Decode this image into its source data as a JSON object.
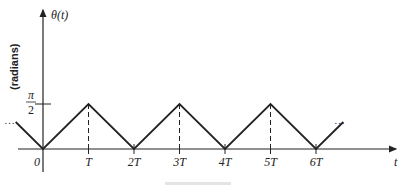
{
  "chart_data": {
    "type": "line",
    "title": "",
    "ylabel_symbol": "θ(t)",
    "ylabel_unit": "(radians)",
    "xlabel": "t",
    "y_tick_label": {
      "numerator": "π",
      "denominator": "2",
      "value": 1.5708
    },
    "x_tick_labels": [
      "0",
      "T",
      "2T",
      "3T",
      "4T",
      "5T",
      "6T"
    ],
    "x_ticks_in_T": [
      0,
      1,
      2,
      3,
      4,
      5,
      6
    ],
    "series": [
      {
        "name": "θ(t) triangular wave",
        "x_in_T": [
          -0.6,
          0,
          1,
          2,
          3,
          4,
          5,
          6,
          6.6
        ],
        "y_in_pi_over_2": [
          0.6,
          0,
          1,
          0,
          1,
          0,
          1,
          0,
          0.6
        ]
      }
    ],
    "peak_markers_in_T": [
      1,
      3,
      5
    ],
    "continuation": "…",
    "xlim_in_T": [
      -0.9,
      7.8
    ],
    "ylim_in_pi_over_2": [
      0,
      3
    ]
  }
}
